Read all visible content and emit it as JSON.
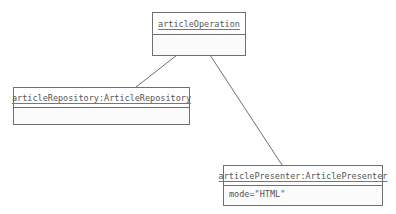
{
  "diagram": {
    "type": "uml-object-diagram",
    "line_color": "#6f6f6f",
    "objects": [
      {
        "id": "articleOperation",
        "name": "articleOperation",
        "attributes": []
      },
      {
        "id": "articleRepository",
        "name": "articleRepository:ArticleRepository",
        "attributes": []
      },
      {
        "id": "articlePresenter",
        "name": "articlePresenter:ArticlePresenter",
        "attributes": [
          "mode=\"HTML\""
        ]
      }
    ],
    "links": [
      {
        "from": "articleOperation",
        "to": "articleRepository"
      },
      {
        "from": "articleOperation",
        "to": "articlePresenter"
      }
    ]
  }
}
